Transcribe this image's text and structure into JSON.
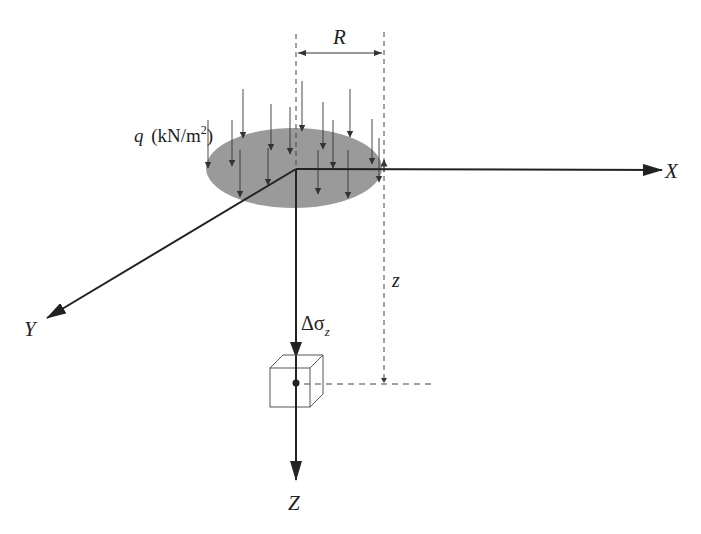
{
  "diagram": {
    "labels": {
      "radius": "R",
      "load": "q",
      "load_units": "(kN/m",
      "load_units_exp": "2",
      "load_units_close": ")",
      "x_axis": "X",
      "y_axis": "Y",
      "z_axis": "Z",
      "depth": "z",
      "stress_delta": "Δσ",
      "stress_sub": "z"
    },
    "colors": {
      "ink": "#222222",
      "load_area": "#999999",
      "dash": "#555555"
    }
  }
}
